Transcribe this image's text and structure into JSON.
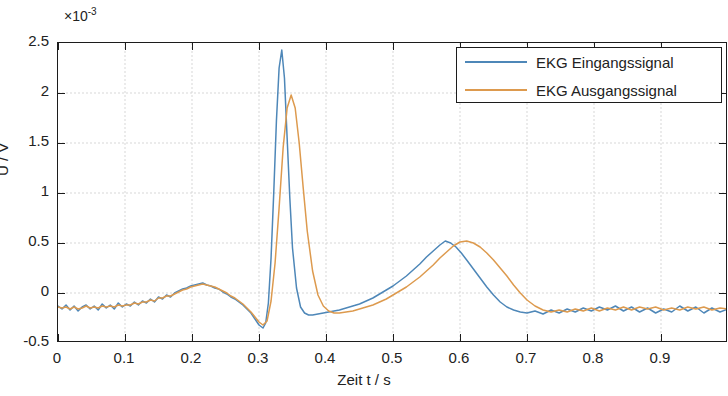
{
  "chart_data": {
    "type": "line",
    "title": "",
    "xlabel": "Zeit t / s",
    "ylabel": "U / V",
    "y_exponent_label": "×10",
    "y_exponent_value": "-3",
    "xlim": [
      0,
      1.0
    ],
    "ylim": [
      -0.5,
      2.5
    ],
    "y_scale_factor": 0.001,
    "grid": true,
    "legend_position": "top-right",
    "xticks": [
      0,
      0.1,
      0.2,
      0.3,
      0.4,
      0.5,
      0.6,
      0.7,
      0.8,
      0.9
    ],
    "xticklabels": [
      "0",
      "0.1",
      "0.2",
      "0.3",
      "0.4",
      "0.5",
      "0.6",
      "0.7",
      "0.8",
      "0.9"
    ],
    "yticks": [
      -0.5,
      0,
      0.5,
      1,
      1.5,
      2,
      2.5
    ],
    "yticklabels": [
      "-0.5",
      "0",
      "0.5",
      "1",
      "1.5",
      "2",
      "2.5"
    ],
    "series": [
      {
        "name": "EKG Eingangssignal",
        "color": "#4e87b8",
        "x": [
          0.0,
          0.006,
          0.012,
          0.018,
          0.024,
          0.03,
          0.036,
          0.042,
          0.048,
          0.054,
          0.06,
          0.066,
          0.072,
          0.078,
          0.084,
          0.09,
          0.096,
          0.102,
          0.108,
          0.114,
          0.12,
          0.126,
          0.132,
          0.138,
          0.144,
          0.15,
          0.156,
          0.162,
          0.168,
          0.174,
          0.18,
          0.186,
          0.192,
          0.198,
          0.204,
          0.21,
          0.216,
          0.222,
          0.228,
          0.234,
          0.24,
          0.246,
          0.252,
          0.258,
          0.264,
          0.27,
          0.276,
          0.282,
          0.288,
          0.294,
          0.3,
          0.306,
          0.31,
          0.314,
          0.318,
          0.322,
          0.326,
          0.33,
          0.334,
          0.338,
          0.342,
          0.346,
          0.35,
          0.356,
          0.362,
          0.368,
          0.374,
          0.38,
          0.388,
          0.396,
          0.404,
          0.412,
          0.42,
          0.43,
          0.44,
          0.45,
          0.46,
          0.47,
          0.48,
          0.49,
          0.5,
          0.51,
          0.52,
          0.53,
          0.54,
          0.55,
          0.56,
          0.57,
          0.578,
          0.586,
          0.594,
          0.602,
          0.61,
          0.62,
          0.63,
          0.64,
          0.65,
          0.66,
          0.67,
          0.68,
          0.69,
          0.7,
          0.712,
          0.724,
          0.736,
          0.748,
          0.76,
          0.772,
          0.784,
          0.796,
          0.808,
          0.82,
          0.832,
          0.844,
          0.856,
          0.868,
          0.88,
          0.892,
          0.904,
          0.916,
          0.928,
          0.94,
          0.952,
          0.964,
          0.976,
          0.988,
          1.0
        ],
        "y": [
          -0.13,
          -0.16,
          -0.12,
          -0.17,
          -0.13,
          -0.18,
          -0.14,
          -0.12,
          -0.16,
          -0.13,
          -0.17,
          -0.11,
          -0.15,
          -0.12,
          -0.16,
          -0.1,
          -0.14,
          -0.11,
          -0.13,
          -0.09,
          -0.12,
          -0.08,
          -0.1,
          -0.06,
          -0.09,
          -0.04,
          -0.06,
          -0.02,
          -0.04,
          0.0,
          0.02,
          0.04,
          0.05,
          0.07,
          0.08,
          0.09,
          0.1,
          0.08,
          0.07,
          0.05,
          0.04,
          0.01,
          -0.01,
          -0.04,
          -0.06,
          -0.09,
          -0.12,
          -0.16,
          -0.2,
          -0.26,
          -0.32,
          -0.35,
          -0.3,
          -0.1,
          0.35,
          1.0,
          1.72,
          2.25,
          2.43,
          2.15,
          1.55,
          0.95,
          0.45,
          0.05,
          -0.14,
          -0.2,
          -0.22,
          -0.22,
          -0.21,
          -0.2,
          -0.19,
          -0.18,
          -0.17,
          -0.15,
          -0.13,
          -0.11,
          -0.08,
          -0.05,
          -0.01,
          0.03,
          0.07,
          0.12,
          0.17,
          0.23,
          0.29,
          0.36,
          0.42,
          0.48,
          0.52,
          0.5,
          0.46,
          0.4,
          0.33,
          0.24,
          0.15,
          0.06,
          -0.02,
          -0.09,
          -0.14,
          -0.17,
          -0.19,
          -0.2,
          -0.18,
          -0.21,
          -0.17,
          -0.2,
          -0.16,
          -0.19,
          -0.15,
          -0.18,
          -0.14,
          -0.17,
          -0.13,
          -0.18,
          -0.14,
          -0.19,
          -0.15,
          -0.2,
          -0.16,
          -0.19,
          -0.13,
          -0.18,
          -0.14,
          -0.2,
          -0.15,
          -0.19,
          -0.16
        ]
      },
      {
        "name": "EKG Ausgangssignal",
        "color": "#dd9a4e",
        "x": [
          0.0,
          0.006,
          0.012,
          0.018,
          0.024,
          0.03,
          0.036,
          0.042,
          0.048,
          0.054,
          0.06,
          0.066,
          0.072,
          0.078,
          0.084,
          0.09,
          0.096,
          0.102,
          0.108,
          0.114,
          0.12,
          0.126,
          0.132,
          0.138,
          0.144,
          0.15,
          0.156,
          0.162,
          0.168,
          0.174,
          0.18,
          0.186,
          0.192,
          0.198,
          0.204,
          0.21,
          0.216,
          0.222,
          0.228,
          0.234,
          0.24,
          0.246,
          0.252,
          0.258,
          0.264,
          0.27,
          0.276,
          0.282,
          0.288,
          0.294,
          0.3,
          0.306,
          0.312,
          0.318,
          0.324,
          0.33,
          0.336,
          0.342,
          0.348,
          0.354,
          0.36,
          0.366,
          0.372,
          0.38,
          0.388,
          0.396,
          0.404,
          0.412,
          0.42,
          0.43,
          0.44,
          0.45,
          0.46,
          0.47,
          0.48,
          0.49,
          0.5,
          0.51,
          0.52,
          0.53,
          0.54,
          0.55,
          0.56,
          0.57,
          0.58,
          0.59,
          0.6,
          0.61,
          0.62,
          0.63,
          0.64,
          0.65,
          0.66,
          0.67,
          0.68,
          0.69,
          0.7,
          0.712,
          0.724,
          0.736,
          0.748,
          0.76,
          0.772,
          0.784,
          0.796,
          0.808,
          0.82,
          0.832,
          0.844,
          0.856,
          0.868,
          0.88,
          0.892,
          0.904,
          0.916,
          0.928,
          0.94,
          0.952,
          0.964,
          0.976,
          0.988,
          1.0
        ],
        "y": [
          -0.14,
          -0.15,
          -0.14,
          -0.16,
          -0.14,
          -0.16,
          -0.15,
          -0.13,
          -0.15,
          -0.14,
          -0.15,
          -0.13,
          -0.14,
          -0.13,
          -0.14,
          -0.12,
          -0.13,
          -0.12,
          -0.12,
          -0.1,
          -0.11,
          -0.09,
          -0.09,
          -0.07,
          -0.08,
          -0.05,
          -0.05,
          -0.03,
          -0.03,
          -0.01,
          0.01,
          0.03,
          0.04,
          0.06,
          0.07,
          0.08,
          0.09,
          0.08,
          0.07,
          0.06,
          0.04,
          0.02,
          0.0,
          -0.03,
          -0.05,
          -0.08,
          -0.11,
          -0.15,
          -0.19,
          -0.24,
          -0.29,
          -0.32,
          -0.28,
          -0.08,
          0.3,
          0.85,
          1.45,
          1.85,
          1.98,
          1.85,
          1.5,
          1.05,
          0.62,
          0.22,
          -0.02,
          -0.13,
          -0.18,
          -0.2,
          -0.2,
          -0.19,
          -0.18,
          -0.16,
          -0.14,
          -0.12,
          -0.09,
          -0.06,
          -0.02,
          0.02,
          0.06,
          0.11,
          0.16,
          0.22,
          0.28,
          0.35,
          0.41,
          0.47,
          0.51,
          0.52,
          0.5,
          0.46,
          0.4,
          0.33,
          0.25,
          0.17,
          0.08,
          0.0,
          -0.07,
          -0.13,
          -0.17,
          -0.19,
          -0.17,
          -0.19,
          -0.16,
          -0.18,
          -0.15,
          -0.18,
          -0.15,
          -0.17,
          -0.14,
          -0.17,
          -0.14,
          -0.16,
          -0.14,
          -0.17,
          -0.15,
          -0.17,
          -0.14,
          -0.16,
          -0.14,
          -0.17,
          -0.15,
          -0.16
        ]
      }
    ]
  },
  "legend": {
    "entries": [
      {
        "label": "EKG Eingangssignal"
      },
      {
        "label": "EKG Ausgangssignal"
      }
    ]
  },
  "axes": {
    "x_title": "Zeit t / s",
    "y_title": "U / V",
    "exponent_prefix": "×10",
    "exponent_sup": "-3"
  }
}
